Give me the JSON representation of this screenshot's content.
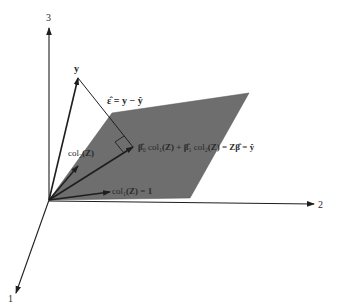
{
  "figure": {
    "axes": {
      "axis_1_label": "1",
      "axis_2_label": "2",
      "axis_3_label": "3"
    },
    "vectors": {
      "y_label": "y",
      "col1_label": "col",
      "col1_sub": "1",
      "col1_suffix": "(Z) = 1",
      "col2_label": "col",
      "col2_sub": "2",
      "col2_suffix": "(Z)"
    },
    "residual": {
      "eps_hat": "ε̂",
      "equals_rhs": " = y − ŷ"
    },
    "projection": {
      "beta0": "β̂",
      "beta0_sub": "0",
      "col1": " col",
      "col1_sub": "1",
      "mid": "(Z) + ",
      "beta1": "β̂",
      "beta1_sub": "1",
      "col2": "  col",
      "col2_sub": "2",
      "tail": "(Z) = Zβ̂ = ŷ"
    },
    "colors": {
      "plane": "#6e6e6e",
      "line": "#1e1e1e",
      "background": "#ffffff"
    }
  }
}
